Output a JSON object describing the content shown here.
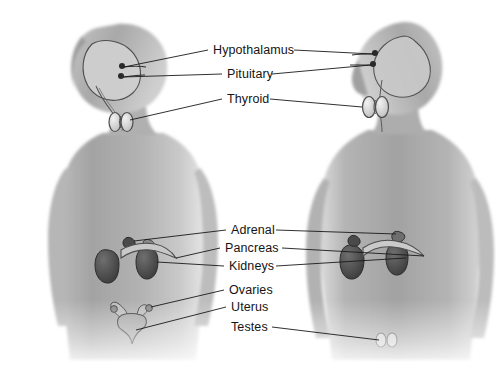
{
  "diagram": {
    "background_color": "#ffffff",
    "body_gray": "#a9a9a9",
    "line_color": "#1a1a1a",
    "label_color": "#141414",
    "labels": [
      {
        "id": "hypothalamus",
        "text": "Hypothalamus"
      },
      {
        "id": "pituitary",
        "text": "Pituitary"
      },
      {
        "id": "thyroid",
        "text": "Thyroid"
      },
      {
        "id": "adrenal",
        "text": "Adrenal"
      },
      {
        "id": "pancreas",
        "text": "Pancreas"
      },
      {
        "id": "kidneys",
        "text": "Kidneys"
      },
      {
        "id": "ovaries",
        "text": "Ovaries"
      },
      {
        "id": "uterus",
        "text": "Uterus"
      },
      {
        "id": "testes",
        "text": "Testes"
      }
    ],
    "figures": [
      {
        "id": "female-figure",
        "side": "left",
        "facing": "right"
      },
      {
        "id": "male-figure",
        "side": "right",
        "facing": "left"
      }
    ]
  }
}
